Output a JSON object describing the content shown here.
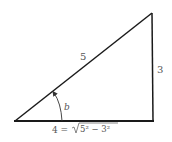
{
  "diagram": {
    "type": "right-triangle",
    "vertices": {
      "left": [
        15,
        121
      ],
      "top_right": [
        152,
        13
      ],
      "bottom_right": [
        153,
        121
      ]
    },
    "labels": {
      "hypotenuse": "5",
      "vertical_leg": "3",
      "angle": "b",
      "base_prefix": "4 = ",
      "base_radical_content": "5² − 3²"
    },
    "colors": {
      "stroke": "#1a1a1a",
      "label": "#555555",
      "background": "#ffffff"
    }
  }
}
